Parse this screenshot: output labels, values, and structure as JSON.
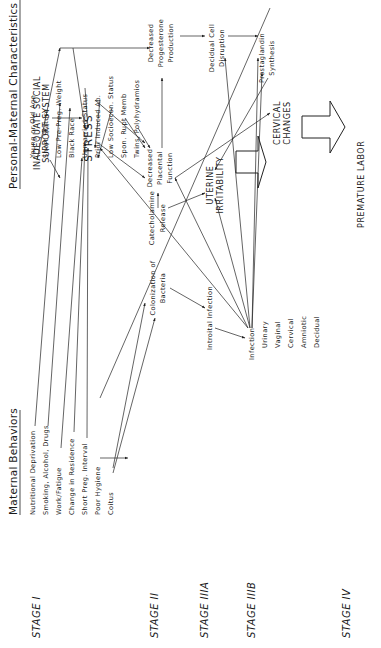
{
  "headers": {
    "personal": "Personal-Maternal Characteristics",
    "behaviors": "Maternal Behaviors"
  },
  "personal_characteristics": [
    "Young or Old Age",
    "Short Stature",
    "Low Pre-Preg. Weight",
    "Black Race",
    "Unmarried Status",
    "Prior Induced Ab.",
    "Low Socioecon. Status",
    "Spon. Rupt Memb",
    "Twins, Polyhydramios"
  ],
  "maternal_behaviors": [
    "Nutritional Deprivation",
    "Smoking, Alcohol, Drugs",
    "Work/Fatigue",
    "Change in Residence",
    "Short Preg. Interval",
    "Poor Hygiene",
    "Coitus"
  ],
  "nodes": {
    "social": [
      "INADEQUATE SOCIAL",
      "SUPPORT SYSTEM"
    ],
    "stress": "STRESS",
    "catecholamine": [
      "Catecholamine",
      "Release"
    ],
    "placental": [
      "Decreased",
      "Placental",
      "Function"
    ],
    "progesterone": [
      "Decreased",
      "Progesterone",
      "Production"
    ],
    "decidual_cell": [
      "Decidual Cell",
      "Disruption"
    ],
    "prostaglandin": [
      "Prostaglandin",
      "Synthesis"
    ],
    "uterine": [
      "UTERINE",
      "IRRITABILITY"
    ],
    "cervical": [
      "CERVICAL",
      "CHANGES"
    ],
    "colonization": [
      "Colonization of",
      "Bacteria"
    ],
    "introital": "Introital Infection",
    "infection": "Infection",
    "infection_types": [
      "Urinary",
      "Vaginal",
      "Cervical",
      "Amniotic",
      "Decidual"
    ],
    "outcome": "PREMATURE  LABOR"
  },
  "stages": [
    {
      "label": "STAGE I"
    },
    {
      "label": "STAGE II"
    },
    {
      "label": "STAGE IIIA"
    },
    {
      "label": "STAGE IIIB"
    },
    {
      "label": "STAGE IV"
    }
  ]
}
